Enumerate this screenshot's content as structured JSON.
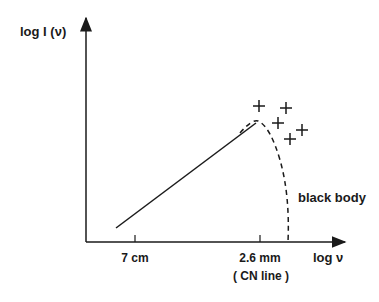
{
  "diagram": {
    "y_axis_label": "log I (ν)",
    "x_axis_label": "log ν",
    "ticks": [
      {
        "label": "7 cm",
        "sublabel": ""
      },
      {
        "label": "2.6 mm",
        "sublabel": "( CN line )"
      }
    ],
    "curve_label": "black body",
    "markers": "+",
    "colors": {
      "ink": "#1a1a1a",
      "background": "#ffffff"
    }
  }
}
